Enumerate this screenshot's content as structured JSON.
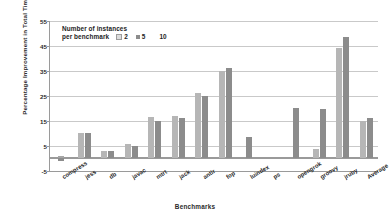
{
  "chart_data": {
    "type": "bar",
    "title": "",
    "xlabel": "Benchmarks",
    "ylabel": "Percentage Improvement in Total Time",
    "ylim": [
      -5,
      55
    ],
    "yticks": [
      -5,
      5,
      15,
      25,
      35,
      45,
      55
    ],
    "grid": true,
    "legend_position": "top-left",
    "legend_title_line1": "Number of  instances",
    "legend_title_line2": "per benchmark",
    "categories": [
      "compress",
      "jess",
      "db",
      "javac",
      "mtrt",
      "jack",
      "antlr",
      "fop",
      "luindex",
      "ps",
      "opengrok",
      "groovy",
      "jruby",
      "Average"
    ],
    "series": [
      {
        "name": "2",
        "color": "#dcdcdc",
        "values": [
          0.8,
          0,
          0,
          0,
          0,
          0,
          0,
          0,
          0,
          0,
          0,
          0,
          0,
          0
        ]
      },
      {
        "name": "5",
        "color": "#b6b6b6",
        "values": [
          0,
          10.0,
          2.8,
          5.5,
          16.5,
          17.0,
          26.0,
          35.0,
          0,
          0,
          0,
          3.5,
          44.0,
          15.0
        ]
      },
      {
        "name": "10",
        "color": "#8c8c8c",
        "values": [
          -1.2,
          10.0,
          2.8,
          4.8,
          15.0,
          16.0,
          25.0,
          36.0,
          8.5,
          0,
          20.0,
          19.5,
          48.5,
          16.0
        ]
      }
    ]
  },
  "axis": {
    "y_title": "Percentage Improvement in Total Time",
    "x_title": "Benchmarks",
    "y_tick_labels": [
      "55",
      "45",
      "35",
      "25",
      "15",
      "5",
      "-5"
    ]
  },
  "legend": {
    "line1": "Number of  instances",
    "line2": "per benchmark",
    "items": [
      {
        "label": "2"
      },
      {
        "label": "5"
      },
      {
        "label": "10"
      }
    ]
  }
}
